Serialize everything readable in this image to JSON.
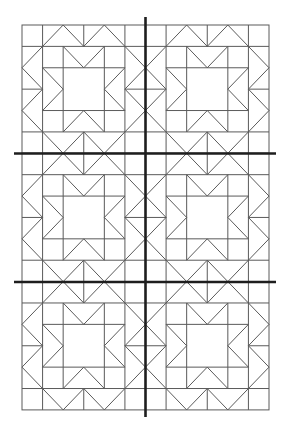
{
  "diagram": {
    "type": "quilt-block-layout",
    "colors": {
      "background": "#ffffff",
      "thin_line": "#5a5a5a",
      "thick_line": "#1e1e1e"
    },
    "layout": {
      "block_columns": 2,
      "block_rows": 3,
      "units_per_block": 6,
      "grid_left": 22,
      "grid_top": 25,
      "block_width": 123.5,
      "block_height": 128.3
    },
    "block_pattern": {
      "name": "star-block",
      "outline": [
        [
          0,
          0
        ],
        [
          6,
          0
        ],
        [
          6,
          6
        ],
        [
          0,
          6
        ]
      ],
      "segments": [
        [
          [
            0,
            1
          ],
          [
            6,
            1
          ]
        ],
        [
          [
            0,
            5
          ],
          [
            6,
            5
          ]
        ],
        [
          [
            1,
            0
          ],
          [
            1,
            6
          ]
        ],
        [
          [
            5,
            0
          ],
          [
            5,
            6
          ]
        ],
        [
          [
            3,
            0
          ],
          [
            3,
            1
          ]
        ],
        [
          [
            3,
            5
          ],
          [
            3,
            6
          ]
        ],
        [
          [
            0,
            3
          ],
          [
            1,
            3
          ]
        ],
        [
          [
            5,
            3
          ],
          [
            6,
            3
          ]
        ],
        [
          [
            2,
            1
          ],
          [
            2,
            5
          ]
        ],
        [
          [
            4,
            1
          ],
          [
            4,
            5
          ]
        ],
        [
          [
            1,
            2
          ],
          [
            5,
            2
          ]
        ],
        [
          [
            1,
            4
          ],
          [
            5,
            4
          ]
        ],
        [
          [
            1,
            1
          ],
          [
            2,
            0
          ]
        ],
        [
          [
            2,
            0
          ],
          [
            3,
            1
          ]
        ],
        [
          [
            3,
            1
          ],
          [
            4,
            0
          ]
        ],
        [
          [
            4,
            0
          ],
          [
            5,
            1
          ]
        ],
        [
          [
            1,
            5
          ],
          [
            2,
            6
          ]
        ],
        [
          [
            2,
            6
          ],
          [
            3,
            5
          ]
        ],
        [
          [
            3,
            5
          ],
          [
            4,
            6
          ]
        ],
        [
          [
            4,
            6
          ],
          [
            5,
            5
          ]
        ],
        [
          [
            1,
            1
          ],
          [
            0,
            2
          ]
        ],
        [
          [
            0,
            2
          ],
          [
            1,
            3
          ]
        ],
        [
          [
            1,
            3
          ],
          [
            0,
            4
          ]
        ],
        [
          [
            0,
            4
          ],
          [
            1,
            5
          ]
        ],
        [
          [
            5,
            1
          ],
          [
            6,
            2
          ]
        ],
        [
          [
            6,
            2
          ],
          [
            5,
            3
          ]
        ],
        [
          [
            5,
            3
          ],
          [
            6,
            4
          ]
        ],
        [
          [
            6,
            4
          ],
          [
            5,
            5
          ]
        ],
        [
          [
            2,
            1
          ],
          [
            3,
            2
          ]
        ],
        [
          [
            3,
            2
          ],
          [
            4,
            1
          ]
        ],
        [
          [
            2,
            5
          ],
          [
            3,
            4
          ]
        ],
        [
          [
            3,
            4
          ],
          [
            4,
            5
          ]
        ],
        [
          [
            1,
            2
          ],
          [
            2,
            3
          ]
        ],
        [
          [
            2,
            3
          ],
          [
            1,
            4
          ]
        ],
        [
          [
            5,
            2
          ],
          [
            4,
            3
          ]
        ],
        [
          [
            4,
            3
          ],
          [
            5,
            4
          ]
        ]
      ]
    },
    "guide_lines": [
      {
        "name": "vertical-center-guide",
        "x1": 145.5,
        "y1": 17,
        "x2": 145.5,
        "y2": 417
      },
      {
        "name": "horizontal-guide-1",
        "x1": 14,
        "y1": 153.5,
        "x2": 276,
        "y2": 153.5
      },
      {
        "name": "horizontal-guide-2",
        "x1": 14,
        "y1": 282,
        "x2": 276,
        "y2": 282
      }
    ]
  }
}
